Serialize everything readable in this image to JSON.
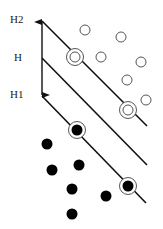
{
  "labels": {
    "h2": "H2",
    "h": "H",
    "h1": "H1"
  },
  "colors": {
    "line": "#111111",
    "positive_stroke": "#555555",
    "negative_fill": "#000000",
    "background": "#ffffff"
  },
  "hyperplanes": [
    {
      "name": "H2",
      "x1": 42,
      "y1": 21,
      "x2": 147,
      "y2": 126
    },
    {
      "name": "H",
      "x1": 42,
      "y1": 58,
      "x2": 147,
      "y2": 165
    },
    {
      "name": "H1",
      "x1": 42,
      "y1": 96,
      "x2": 146,
      "y2": 203
    }
  ],
  "margin_arrow": {
    "x": 42,
    "y_top": 21,
    "y_bottom": 96
  },
  "open_points": [
    {
      "x": 85,
      "y": 30
    },
    {
      "x": 121,
      "y": 37
    },
    {
      "x": 101,
      "y": 57
    },
    {
      "x": 141,
      "y": 62
    },
    {
      "x": 127,
      "y": 80
    },
    {
      "x": 146,
      "y": 100
    }
  ],
  "open_support_vectors": [
    {
      "x": 75,
      "y": 57
    },
    {
      "x": 128,
      "y": 110
    }
  ],
  "filled_points": [
    {
      "x": 47,
      "y": 144
    },
    {
      "x": 52,
      "y": 170
    },
    {
      "x": 79,
      "y": 165
    },
    {
      "x": 72,
      "y": 189
    },
    {
      "x": 72,
      "y": 214
    },
    {
      "x": 106,
      "y": 196
    }
  ],
  "filled_support_vectors": [
    {
      "x": 77,
      "y": 130
    },
    {
      "x": 128,
      "y": 186
    }
  ]
}
